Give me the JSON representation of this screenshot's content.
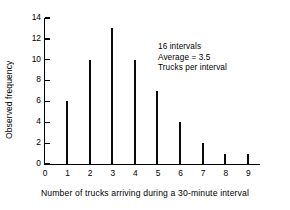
{
  "chart_data": {
    "type": "bar",
    "title": "",
    "xlabel": "Number of trucks arriving during a 30-minute interval",
    "ylabel": "Observed frequency",
    "categories": [
      "0",
      "1",
      "2",
      "3",
      "4",
      "5",
      "6",
      "7",
      "8",
      "9"
    ],
    "values": [
      0,
      6,
      10,
      13,
      10,
      7,
      4,
      2,
      1,
      1
    ],
    "xlim": [
      0,
      9
    ],
    "ylim": [
      0,
      14
    ],
    "yticks": [
      0,
      2,
      4,
      6,
      8,
      10,
      12,
      14
    ],
    "xticks": [
      0,
      1,
      2,
      3,
      4,
      5,
      6,
      7,
      8,
      9
    ],
    "grid": false,
    "legend": null,
    "bar_color": "#0a0a0a",
    "annotations": [
      "16 intervals",
      "Average = 3.5",
      "Trucks per interval"
    ]
  },
  "annotation": {
    "line1": "16 intervals",
    "line2": "Average = 3.5",
    "line3": "Trucks per interval"
  }
}
